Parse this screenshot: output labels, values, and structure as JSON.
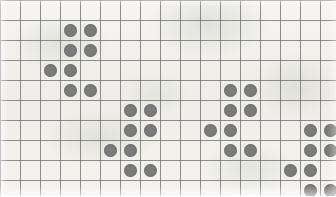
{
  "canvas": {
    "width": 336,
    "height": 196,
    "background_color": "#f2f1ec",
    "description": "dot-grid-pattern"
  },
  "grid": {
    "columns": 17,
    "rows": 10,
    "cell_width": 20,
    "cell_height": 20,
    "origin_x": 0,
    "origin_y": 0,
    "line_color": "#6f6f6c",
    "line_width": 1,
    "grid_visible": "true"
  },
  "dot_style": {
    "fill_color": "#7b7b79",
    "diameter": 13,
    "shape": "circle"
  },
  "chart_data": {
    "type": "scatter",
    "title": "",
    "subtitle": "",
    "xlabel": "",
    "ylabel": "",
    "grid": "on",
    "legend": "none",
    "xlim": [
      0,
      17
    ],
    "ylim": [
      0,
      10
    ],
    "xticks": [
      0,
      1,
      2,
      3,
      4,
      5,
      6,
      7,
      8,
      9,
      10,
      11,
      12,
      13,
      14,
      15,
      16,
      17
    ],
    "yticks": [
      0,
      1,
      2,
      3,
      4,
      5,
      6,
      7,
      8,
      9,
      10
    ],
    "xticklabels": [],
    "yticklabels": [],
    "marker": "o",
    "marker_color": "#7b7b79",
    "marker_size": 13,
    "point_count": 28,
    "points": [
      {
        "col": 3,
        "row": 1
      },
      {
        "col": 4,
        "row": 1
      },
      {
        "col": 3,
        "row": 2
      },
      {
        "col": 4,
        "row": 2
      },
      {
        "col": 2,
        "row": 3
      },
      {
        "col": 3,
        "row": 3
      },
      {
        "col": 3,
        "row": 4
      },
      {
        "col": 4,
        "row": 4
      },
      {
        "col": 6,
        "row": 5
      },
      {
        "col": 7,
        "row": 5
      },
      {
        "col": 6,
        "row": 6
      },
      {
        "col": 7,
        "row": 6
      },
      {
        "col": 5,
        "row": 7
      },
      {
        "col": 6,
        "row": 7
      },
      {
        "col": 6,
        "row": 8
      },
      {
        "col": 7,
        "row": 8
      },
      {
        "col": 11,
        "row": 4
      },
      {
        "col": 12,
        "row": 4
      },
      {
        "col": 11,
        "row": 5
      },
      {
        "col": 12,
        "row": 5
      },
      {
        "col": 10,
        "row": 6
      },
      {
        "col": 11,
        "row": 6
      },
      {
        "col": 11,
        "row": 7
      },
      {
        "col": 12,
        "row": 7
      },
      {
        "col": 15,
        "row": 6
      },
      {
        "col": 16,
        "row": 6
      },
      {
        "col": 15,
        "row": 7
      },
      {
        "col": 16,
        "row": 7
      },
      {
        "col": 14,
        "row": 8
      },
      {
        "col": 15,
        "row": 8
      },
      {
        "col": 15,
        "row": 9
      },
      {
        "col": 16,
        "row": 9
      }
    ],
    "clusters": [
      {
        "name": "cluster-1",
        "anchor_col": 3,
        "anchor_row": 1
      },
      {
        "name": "cluster-2",
        "anchor_col": 6,
        "anchor_row": 5
      },
      {
        "name": "cluster-3",
        "anchor_col": 11,
        "anchor_row": 4
      },
      {
        "name": "cluster-4",
        "anchor_col": 15,
        "anchor_row": 6
      }
    ]
  }
}
